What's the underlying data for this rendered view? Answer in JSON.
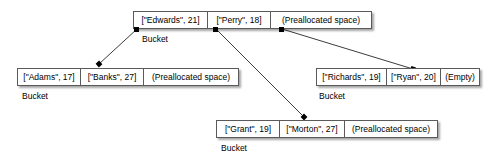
{
  "diagram": {
    "kind": "hash-table-bucket-diagram",
    "bucket_label": "Bucket",
    "buckets": [
      {
        "id": "root",
        "label": "Bucket",
        "cells": [
          {
            "text": "[\"Edwards\", 21]",
            "kind": "entry"
          },
          {
            "text": "[\"Perry\", 18]",
            "kind": "entry"
          },
          {
            "text": "(Preallocated space)",
            "kind": "free"
          }
        ]
      },
      {
        "id": "left",
        "label": "Bucket",
        "cells": [
          {
            "text": "[\"Adams\", 17]",
            "kind": "entry"
          },
          {
            "text": "[\"Banks\", 27]",
            "kind": "entry"
          },
          {
            "text": "(Preallocated space)",
            "kind": "free"
          }
        ]
      },
      {
        "id": "right",
        "label": "Bucket",
        "cells": [
          {
            "text": "[\"Richards\", 19]",
            "kind": "entry"
          },
          {
            "text": "[\"Ryan\", 20]",
            "kind": "entry"
          },
          {
            "text": "(Empty)",
            "kind": "empty"
          }
        ]
      },
      {
        "id": "bottom",
        "label": "Bucket",
        "cells": [
          {
            "text": "[\"Grant\", 19]",
            "kind": "entry"
          },
          {
            "text": "[\"Morton\", 27]",
            "kind": "entry"
          },
          {
            "text": "(Preallocated space)",
            "kind": "free"
          }
        ]
      }
    ],
    "colors": {
      "line": "#3c3c3c",
      "box_border": "#5a5a5a",
      "box_fill": "#ffffff",
      "anchor": "#000000",
      "text": "#000000",
      "background": "#ffffff"
    }
  }
}
